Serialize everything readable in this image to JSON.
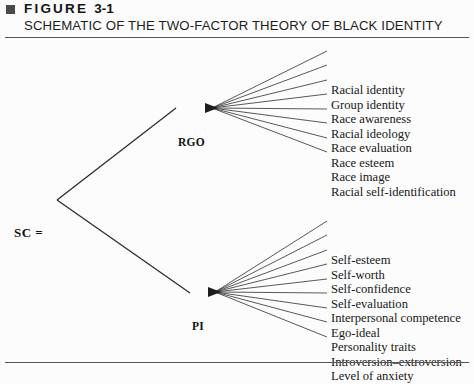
{
  "figure": {
    "bullet_icon": "square-bullet-icon",
    "label": "FIGURE",
    "number": "3-1",
    "title": "SCHEMATIC OF THE TWO-FACTOR THEORY OF BLACK IDENTITY"
  },
  "diagram": {
    "type": "tree",
    "root": {
      "id": "sc",
      "label": "SC ="
    },
    "branches": [
      {
        "id": "rgo",
        "label": "RGO",
        "leaves": [
          "Racial identity",
          "Group identity",
          "Race awareness",
          "Racial ideology",
          "Race evaluation",
          "Race esteem",
          "Race image",
          "Racial self-identification"
        ]
      },
      {
        "id": "pi",
        "label": "PI",
        "leaves": [
          "Self-esteem",
          "Self-worth",
          "Self-confidence",
          "Self-evaluation",
          "Interpersonal competence",
          "Ego-ideal",
          "Personality traits",
          "Introversion–extroversion",
          "Level of anxiety"
        ]
      }
    ]
  },
  "colors": {
    "background": "#fcfcfc",
    "ink": "#1a1a1a",
    "rule": "#555555",
    "bullet": "#4a4a4a"
  }
}
